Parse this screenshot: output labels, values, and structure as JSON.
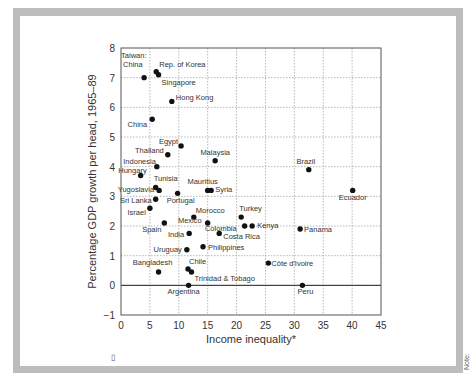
{
  "chart_data": {
    "type": "scatter",
    "title": "",
    "xlabel": "Income inequality*",
    "ylabel": "Percentage GDP growth per head, 1965–89",
    "xlim": [
      0,
      45
    ],
    "ylim": [
      -1,
      8
    ],
    "xticks": [
      0,
      5,
      10,
      15,
      20,
      25,
      30,
      35,
      40,
      45
    ],
    "yticks": [
      -1,
      0,
      1,
      2,
      3,
      4,
      5,
      6,
      7,
      8
    ],
    "xtick_labels": [
      "0",
      "5",
      "10",
      "15",
      "20",
      "25",
      "30",
      "35",
      "40",
      "45"
    ],
    "ytick_labels": [
      "−1",
      "0",
      "1",
      "2",
      "3",
      "4",
      "5",
      "6",
      "7",
      "8"
    ],
    "grid": true,
    "zero_line": true,
    "legend": null,
    "points": [
      {
        "label": "Taiwan: China",
        "x": 4.0,
        "y": 7.0
      },
      {
        "label": "Rep. of Korea",
        "x": 6.1,
        "y": 7.2
      },
      {
        "label": "Singapore",
        "x": 6.5,
        "y": 7.1
      },
      {
        "label": "Hong Kong",
        "x": 8.8,
        "y": 6.2
      },
      {
        "label": "China",
        "x": 5.4,
        "y": 5.6
      },
      {
        "label": "Egypt",
        "x": 10.4,
        "y": 4.7
      },
      {
        "label": "Thailand",
        "x": 8.1,
        "y": 4.4
      },
      {
        "label": "Indonesia",
        "x": 6.2,
        "y": 4.0
      },
      {
        "label": "Hungary",
        "x": 3.4,
        "y": 3.7
      },
      {
        "label": "Malaysia",
        "x": 16.3,
        "y": 4.2
      },
      {
        "label": "Tunisia",
        "x": 6.0,
        "y": 3.3
      },
      {
        "label": "Yugoslavia",
        "x": 6.6,
        "y": 3.2
      },
      {
        "label": "Portugal",
        "x": 9.8,
        "y": 3.1
      },
      {
        "label": "Mauritius",
        "x": 15.0,
        "y": 3.2
      },
      {
        "label": "Syria",
        "x": 15.6,
        "y": 3.2
      },
      {
        "label": "Sri Lanka",
        "x": 6.0,
        "y": 2.9
      },
      {
        "label": "Israel",
        "x": 5.0,
        "y": 2.6
      },
      {
        "label": "Spain",
        "x": 7.5,
        "y": 2.1
      },
      {
        "label": "Morocco",
        "x": 12.6,
        "y": 2.3
      },
      {
        "label": "Mexico",
        "x": 15.0,
        "y": 2.1
      },
      {
        "label": "Turkey",
        "x": 20.8,
        "y": 2.3
      },
      {
        "label": "Colombia",
        "x": 21.4,
        "y": 2.0
      },
      {
        "label": "Kenya",
        "x": 22.7,
        "y": 2.0
      },
      {
        "label": "Costa Rica",
        "x": 17.0,
        "y": 1.75
      },
      {
        "label": "India",
        "x": 11.8,
        "y": 1.75
      },
      {
        "label": "Brazil",
        "x": 32.5,
        "y": 3.9
      },
      {
        "label": "Ecuador",
        "x": 40.1,
        "y": 3.2
      },
      {
        "label": "Panama",
        "x": 31.0,
        "y": 1.9
      },
      {
        "label": "Philippines",
        "x": 14.2,
        "y": 1.3
      },
      {
        "label": "Uruguay",
        "x": 11.4,
        "y": 1.2
      },
      {
        "label": "Côte d'Ivoire",
        "x": 25.5,
        "y": 0.75
      },
      {
        "label": "Chile",
        "x": 11.6,
        "y": 0.55
      },
      {
        "label": "Trinidad & Tobago",
        "x": 12.2,
        "y": 0.45
      },
      {
        "label": "Bangladesh",
        "x": 6.5,
        "y": 0.45
      },
      {
        "label": "Argentina",
        "x": 11.7,
        "y": 0.0
      },
      {
        "label": "Peru",
        "x": 31.4,
        "y": 0.0
      }
    ]
  },
  "label_layout": [
    {
      "text": "Taiwan:",
      "dx": -23,
      "dy": -20,
      "anchor": "start"
    },
    {
      "text": "Rep. of Korea",
      "dx": 3,
      "dy": -5,
      "anchor": "start"
    },
    {
      "text": "Singapore",
      "dx": 3,
      "dy": 10,
      "anchor": "start"
    },
    {
      "text": "Hong Kong",
      "dx": 4,
      "dy": -1,
      "anchor": "start"
    },
    {
      "text": "China",
      "dx": -5,
      "dy": 8,
      "anchor": "end"
    },
    {
      "text": "Egypt",
      "dx": -3,
      "dy": -2,
      "anchor": "end"
    },
    {
      "text": "Thailand",
      "dx": -4,
      "dy": -2,
      "anchor": "end"
    },
    {
      "text": "Indonesia",
      "dx": -1,
      "dy": -3,
      "anchor": "end"
    },
    {
      "text": "Hungary",
      "dx": 6,
      "dy": -3,
      "anchor": "end"
    },
    {
      "text": "Malaysia",
      "dx": 0,
      "dy": -6,
      "anchor": "middle"
    },
    {
      "text": "Tunisia",
      "dx": -2,
      "dy": -6,
      "anchor": "start"
    },
    {
      "text": "Yugoslavia",
      "dx": -5,
      "dy": 2,
      "anchor": "end"
    },
    {
      "text": "Portugal",
      "dx": 3,
      "dy": 10,
      "anchor": "middle"
    },
    {
      "text": "Mauritius",
      "dx": -5,
      "dy": -6,
      "anchor": "middle"
    },
    {
      "text": "Syria",
      "dx": 4,
      "dy": 2,
      "anchor": "start"
    },
    {
      "text": "Sri Lanka",
      "dx": -4,
      "dy": 4,
      "anchor": "end"
    },
    {
      "text": "Israel",
      "dx": -4,
      "dy": 7,
      "anchor": "end"
    },
    {
      "text": "Spain",
      "dx": -3,
      "dy": 9,
      "anchor": "end"
    },
    {
      "text": "Morocco",
      "dx": 2,
      "dy": -4,
      "anchor": "start"
    },
    {
      "text": "Mexico",
      "dx": -6,
      "dy": 0,
      "anchor": "end"
    },
    {
      "text": "Turkey",
      "dx": -2,
      "dy": -6,
      "anchor": "start"
    },
    {
      "text": "Colombia",
      "dx": -8,
      "dy": 5,
      "anchor": "end"
    },
    {
      "text": "Kenya",
      "dx": 5,
      "dy": 2,
      "anchor": "start"
    },
    {
      "text": "Costa Rica",
      "dx": 4,
      "dy": 6,
      "anchor": "start"
    },
    {
      "text": "India",
      "dx": -5,
      "dy": 4,
      "anchor": "end"
    },
    {
      "text": "Brazil",
      "dx": -3,
      "dy": -6,
      "anchor": "middle"
    },
    {
      "text": "Ecuador",
      "dx": 0,
      "dy": 10,
      "anchor": "middle"
    },
    {
      "text": "Panama",
      "dx": 4,
      "dy": 3,
      "anchor": "start"
    },
    {
      "text": "Philippines",
      "dx": 5,
      "dy": 3,
      "anchor": "start"
    },
    {
      "text": "Uruguay",
      "dx": -5,
      "dy": 2,
      "anchor": "end"
    },
    {
      "text": "Côte d'Ivoire",
      "dx": 3,
      "dy": 3,
      "anchor": "start"
    },
    {
      "text": "Chile",
      "dx": 1,
      "dy": -5,
      "anchor": "start"
    },
    {
      "text": "Trinidad & Tobago",
      "dx": 3,
      "dy": 9,
      "anchor": "start"
    },
    {
      "text": "Bangladesh",
      "dx": -6,
      "dy": -7,
      "anchor": "middle"
    },
    {
      "text": "Argentina",
      "dx": -5,
      "dy": 9,
      "anchor": "middle"
    },
    {
      "text": "Peru",
      "dx": 3,
      "dy": 9,
      "anchor": "middle"
    }
  ],
  "extra_labels": {
    "taiwan_second_line": "China"
  },
  "footnote_marker": "▯",
  "side_note": "Note:"
}
